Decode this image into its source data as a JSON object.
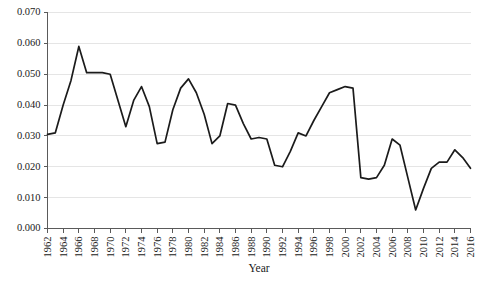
{
  "chart_data": {
    "type": "line",
    "title": "",
    "xlabel": "Year",
    "ylabel": "",
    "xlim": [
      1962,
      2016
    ],
    "ylim": [
      0.0,
      0.07
    ],
    "grid": true,
    "legend": "none",
    "line_color": "#1b1b1b",
    "grid_color": "#e2e2e2",
    "axis_color": "#5a5a5a",
    "ytick_labels": [
      "0.000",
      "0.010",
      "0.020",
      "0.030",
      "0.040",
      "0.050",
      "0.060",
      "0.070"
    ],
    "ytick_values": [
      0.0,
      0.01,
      0.02,
      0.03,
      0.04,
      0.05,
      0.06,
      0.07
    ],
    "xtick_labels": [
      "1962",
      "1964",
      "1966",
      "1968",
      "1970",
      "1972",
      "1974",
      "1976",
      "1978",
      "1980",
      "1982",
      "1984",
      "1986",
      "1988",
      "1990",
      "1992",
      "1994",
      "1996",
      "1998",
      "2000",
      "2002",
      "2004",
      "2006",
      "2008",
      "2010",
      "2012",
      "2014",
      "2016"
    ],
    "xtick_values": [
      1962,
      1964,
      1966,
      1968,
      1970,
      1972,
      1974,
      1976,
      1978,
      1980,
      1982,
      1984,
      1986,
      1988,
      1990,
      1992,
      1994,
      1996,
      1998,
      2000,
      2002,
      2004,
      2006,
      2008,
      2010,
      2012,
      2014,
      2016
    ],
    "x": [
      1962,
      1963,
      1964,
      1965,
      1966,
      1967,
      1968,
      1969,
      1970,
      1971,
      1972,
      1973,
      1974,
      1975,
      1976,
      1977,
      1978,
      1979,
      1980,
      1981,
      1982,
      1983,
      1984,
      1985,
      1986,
      1987,
      1988,
      1989,
      1990,
      1991,
      1992,
      1993,
      1994,
      1995,
      1996,
      1997,
      1998,
      1999,
      2000,
      2001,
      2002,
      2003,
      2004,
      2005,
      2006,
      2007,
      2008,
      2009,
      2010,
      2011,
      2012,
      2013,
      2014,
      2015,
      2016
    ],
    "values": [
      0.0305,
      0.031,
      0.04,
      0.048,
      0.059,
      0.0505,
      0.0505,
      0.0505,
      0.05,
      0.0415,
      0.033,
      0.0415,
      0.046,
      0.0395,
      0.0275,
      0.028,
      0.0385,
      0.0455,
      0.0485,
      0.044,
      0.037,
      0.0275,
      0.03,
      0.0405,
      0.04,
      0.034,
      0.029,
      0.0295,
      0.029,
      0.0205,
      0.02,
      0.025,
      0.031,
      0.03,
      0.035,
      0.0395,
      0.044,
      0.045,
      0.046,
      0.0455,
      0.0165,
      0.016,
      0.0165,
      0.0205,
      0.029,
      0.027,
      0.0165,
      0.006,
      0.013,
      0.0195,
      0.0215,
      0.0215,
      0.0255,
      0.023,
      0.0195
    ]
  },
  "axis": {
    "x_title": "Year"
  }
}
